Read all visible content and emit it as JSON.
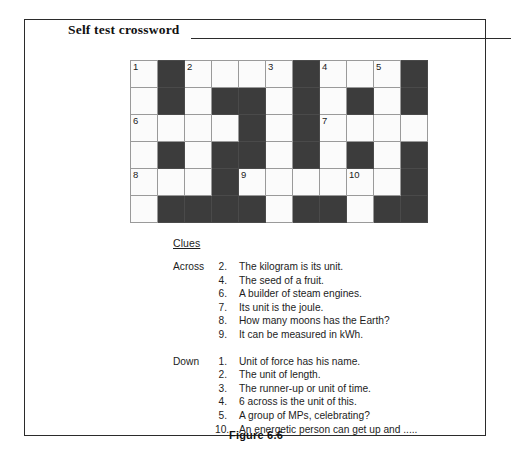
{
  "panel": {
    "title": "Self test crossword",
    "caption": "Figure 6.6"
  },
  "grid": {
    "columns": 11,
    "rows": 6,
    "colors": {
      "white_cell": "#fbfbfb",
      "black_cell": "#3c3c3c",
      "grid_line": "#9a9a9a"
    },
    "cells": [
      [
        {
          "type": "white",
          "number": "1"
        },
        {
          "type": "black",
          "number": ""
        },
        {
          "type": "white",
          "number": "2"
        },
        {
          "type": "white",
          "number": ""
        },
        {
          "type": "white",
          "number": ""
        },
        {
          "type": "white",
          "number": "3"
        },
        {
          "type": "black",
          "number": ""
        },
        {
          "type": "white",
          "number": "4"
        },
        {
          "type": "white",
          "number": ""
        },
        {
          "type": "white",
          "number": "5"
        },
        {
          "type": "black",
          "number": ""
        }
      ],
      [
        {
          "type": "white",
          "number": ""
        },
        {
          "type": "black",
          "number": ""
        },
        {
          "type": "white",
          "number": ""
        },
        {
          "type": "black",
          "number": ""
        },
        {
          "type": "black",
          "number": ""
        },
        {
          "type": "white",
          "number": ""
        },
        {
          "type": "black",
          "number": ""
        },
        {
          "type": "white",
          "number": ""
        },
        {
          "type": "black",
          "number": ""
        },
        {
          "type": "white",
          "number": ""
        },
        {
          "type": "black",
          "number": ""
        }
      ],
      [
        {
          "type": "white",
          "number": "6"
        },
        {
          "type": "white",
          "number": ""
        },
        {
          "type": "white",
          "number": ""
        },
        {
          "type": "white",
          "number": ""
        },
        {
          "type": "black",
          "number": ""
        },
        {
          "type": "white",
          "number": ""
        },
        {
          "type": "black",
          "number": ""
        },
        {
          "type": "white",
          "number": "7"
        },
        {
          "type": "white",
          "number": ""
        },
        {
          "type": "white",
          "number": ""
        },
        {
          "type": "white",
          "number": ""
        }
      ],
      [
        {
          "type": "white",
          "number": ""
        },
        {
          "type": "black",
          "number": ""
        },
        {
          "type": "white",
          "number": ""
        },
        {
          "type": "black",
          "number": ""
        },
        {
          "type": "black",
          "number": ""
        },
        {
          "type": "white",
          "number": ""
        },
        {
          "type": "black",
          "number": ""
        },
        {
          "type": "white",
          "number": ""
        },
        {
          "type": "black",
          "number": ""
        },
        {
          "type": "white",
          "number": ""
        },
        {
          "type": "black",
          "number": ""
        }
      ],
      [
        {
          "type": "white",
          "number": "8"
        },
        {
          "type": "white",
          "number": ""
        },
        {
          "type": "white",
          "number": ""
        },
        {
          "type": "black",
          "number": ""
        },
        {
          "type": "white",
          "number": "9"
        },
        {
          "type": "white",
          "number": ""
        },
        {
          "type": "white",
          "number": ""
        },
        {
          "type": "white",
          "number": ""
        },
        {
          "type": "white",
          "number": "10"
        },
        {
          "type": "white",
          "number": ""
        },
        {
          "type": "black",
          "number": ""
        }
      ],
      [
        {
          "type": "white",
          "number": ""
        },
        {
          "type": "black",
          "number": ""
        },
        {
          "type": "black",
          "number": ""
        },
        {
          "type": "black",
          "number": ""
        },
        {
          "type": "black",
          "number": ""
        },
        {
          "type": "white",
          "number": ""
        },
        {
          "type": "black",
          "number": ""
        },
        {
          "type": "black",
          "number": ""
        },
        {
          "type": "white",
          "number": ""
        },
        {
          "type": "black",
          "number": ""
        },
        {
          "type": "black",
          "number": ""
        }
      ]
    ]
  },
  "clues": {
    "heading": "Clues",
    "across": {
      "label": "Across",
      "items": [
        {
          "num": "2.",
          "text": "The kilogram is its unit."
        },
        {
          "num": "4.",
          "text": "The seed of a fruit."
        },
        {
          "num": "6.",
          "text": "A builder of steam engines."
        },
        {
          "num": "7.",
          "text": "Its unit is the joule."
        },
        {
          "num": "8.",
          "text": "How many moons has the Earth?"
        },
        {
          "num": "9.",
          "text": "It can be measured in kWh."
        }
      ]
    },
    "down": {
      "label": "Down",
      "items": [
        {
          "num": "1.",
          "text": "Unit of force has his name."
        },
        {
          "num": "2.",
          "text": "The unit of length."
        },
        {
          "num": "3.",
          "text": "The runner-up or unit of time."
        },
        {
          "num": "4.",
          "text": "6 across is the unit of this."
        },
        {
          "num": "5.",
          "text": "A group of MPs,  celebrating?"
        },
        {
          "num": "10.",
          "text": "An energetic person can get up and ....."
        }
      ]
    }
  }
}
